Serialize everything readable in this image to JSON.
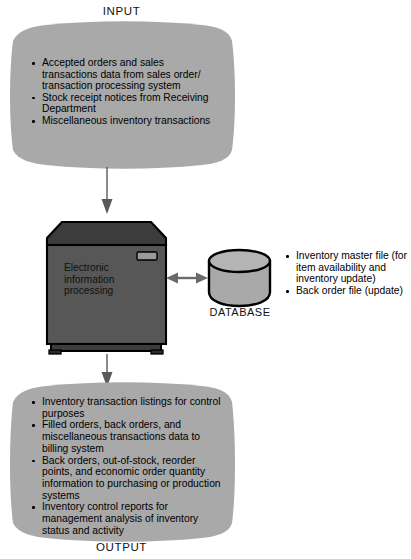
{
  "diagram": {
    "colors": {
      "fill_gray": "#a9a9a9",
      "processor_dark": "#4e4e4e",
      "processor_top": "#3b3b3b",
      "outline": "#000000",
      "background": "#ffffff",
      "arrow": "#555555"
    },
    "input": {
      "caption": "INPUT",
      "items": [
        "Accepted orders and sales transactions data from sales order/ transaction processing system",
        "Stock receipt notices from Receiving Department",
        "Miscellaneous inventory transactions"
      ]
    },
    "processing": {
      "label": "Electronic information processing",
      "icon": "computer-box-icon"
    },
    "database": {
      "caption": "DATABASE",
      "icon": "cylinder-database-icon",
      "items": [
        "Inventory master file (for item availability and inventory update)",
        "Back order file (update)"
      ]
    },
    "output": {
      "caption": "OUTPUT",
      "items": [
        "Inventory transaction listings for control purposes",
        "Filled orders, back orders, and miscellaneous transactions data to billing system",
        "Back orders, out-of-stock, reorder points, and economic order quantity information to purchasing or production systems",
        "Inventory control reports for management analysis of inventory status and activity"
      ]
    },
    "connectors": [
      {
        "name": "input-to-processing-arrow",
        "direction": "down"
      },
      {
        "name": "processing-to-database-arrow",
        "direction": "bidirectional"
      },
      {
        "name": "processing-to-output-arrow",
        "direction": "down"
      }
    ]
  }
}
